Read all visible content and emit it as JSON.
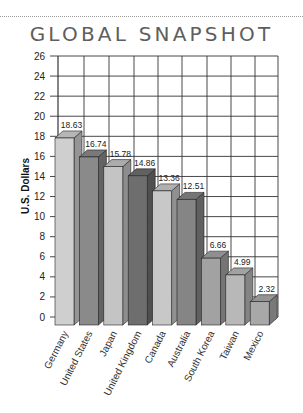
{
  "title": "GLOBAL SNAPSHOT",
  "chart_data": {
    "type": "bar",
    "title": "GLOBAL SNAPSHOT",
    "xlabel": "",
    "ylabel": "U.S. Dollars",
    "ylim": [
      0,
      26
    ],
    "yticks": [
      0,
      2,
      4,
      6,
      8,
      10,
      12,
      14,
      16,
      18,
      20,
      22,
      24,
      26
    ],
    "grid": true,
    "legend": null,
    "style": "3d",
    "categories": [
      "Germany",
      "United States",
      "Japan",
      "United Kingdom",
      "Canada",
      "Australia",
      "South Korea",
      "Taiwan",
      "Mexico"
    ],
    "values": [
      18.63,
      16.74,
      15.78,
      14.86,
      13.36,
      12.51,
      6.66,
      4.99,
      2.32
    ],
    "value_labels": [
      "18.63",
      "16.74",
      "15.78",
      "14.86",
      "13.36",
      "12.51",
      "6.66",
      "4.99",
      "2.32"
    ],
    "bar_colors": [
      "#cfcfcf",
      "#8a8a8a",
      "#c4c4c4",
      "#6e6e6e",
      "#c8c8c8",
      "#858585",
      "#a2a2a2",
      "#b8b8b8",
      "#a8a8a8"
    ]
  }
}
